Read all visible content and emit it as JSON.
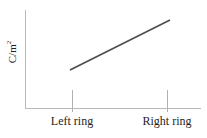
{
  "figure": {
    "width": 207,
    "height": 138,
    "background": "#ffffff"
  },
  "chart_data": {
    "type": "line",
    "title": "",
    "subtitle": "",
    "xlabel": "",
    "ylabel": "C/m2",
    "ylabel_display": "C/m",
    "ylabel_superscript": "2",
    "categories": [
      "Left ring",
      "Right ring"
    ],
    "x": [
      1,
      2
    ],
    "series": [
      {
        "name": "charge density",
        "values": [
          0.38,
          0.88
        ],
        "color": "#4d4d4d",
        "line_width": 1.6,
        "markers": false
      }
    ],
    "tick_labels": [
      "Left ring",
      "Right ring"
    ],
    "y_tick_labels": [],
    "ylim": [
      0,
      1
    ],
    "xlim": [
      0.5,
      2.5
    ],
    "grid": false,
    "legend": false,
    "legend_position": "none",
    "annotations": [],
    "axis_color": "#b9b9b9",
    "tick_color": "#b0b0b0",
    "text_color": "#1d1d1d"
  },
  "axes": {
    "y_axis_name": "y-axis-line",
    "x_axis_name": "x-axis-line"
  },
  "ticks": [
    {
      "label": "Left ring",
      "x_px": 72
    },
    {
      "label": "Right ring",
      "x_px": 167
    }
  ],
  "line_geometry": {
    "x1": 70,
    "y1": 70,
    "x2": 170,
    "y2": 20
  }
}
